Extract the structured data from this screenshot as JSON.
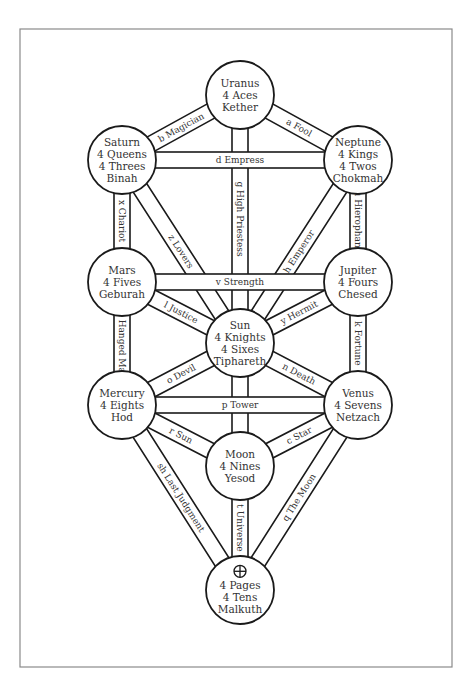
{
  "diagram": {
    "colors": {
      "line": "#1a1a1a",
      "text": "#333333",
      "frame": "#8a8a8a",
      "background": "#ffffff"
    },
    "nodes": [
      {
        "id": "kether",
        "x": 240,
        "y": 95,
        "r": 34,
        "lines": [
          "Uranus",
          "4 Aces",
          "Kether"
        ]
      },
      {
        "id": "chokmah",
        "x": 358,
        "y": 160,
        "r": 34,
        "lines": [
          "Neptune",
          "4 Kings",
          "4 Twos",
          "Chokmah"
        ]
      },
      {
        "id": "binah",
        "x": 122,
        "y": 160,
        "r": 34,
        "lines": [
          "Saturn",
          "4 Queens",
          "4 Threes",
          "Binah"
        ]
      },
      {
        "id": "chesed",
        "x": 358,
        "y": 282,
        "r": 34,
        "lines": [
          "Jupiter",
          "4 Fours",
          "Chesed"
        ]
      },
      {
        "id": "geburah",
        "x": 122,
        "y": 282,
        "r": 34,
        "lines": [
          "Mars",
          "4 Fives",
          "Geburah"
        ]
      },
      {
        "id": "tiphareth",
        "x": 240,
        "y": 343,
        "r": 34,
        "lines": [
          "Sun",
          "4 Knights",
          "4 Sixes",
          "Tiphareth"
        ]
      },
      {
        "id": "netzach",
        "x": 358,
        "y": 405,
        "r": 34,
        "lines": [
          "Venus",
          "4 Sevens",
          "Netzach"
        ]
      },
      {
        "id": "hod",
        "x": 122,
        "y": 405,
        "r": 34,
        "lines": [
          "Mercury",
          "4 Eights",
          "Hod"
        ]
      },
      {
        "id": "yesod",
        "x": 240,
        "y": 466,
        "r": 34,
        "lines": [
          "Moon",
          "4 Nines",
          "Yesod"
        ]
      },
      {
        "id": "malkuth",
        "x": 240,
        "y": 590,
        "r": 34,
        "lines": [
          "4 Pages",
          "4 Tens",
          "Malkuth"
        ],
        "glyph": "earth-symbol"
      }
    ],
    "paths": [
      {
        "from": "kether",
        "to": "chokmah",
        "letter": "a",
        "card": "Fool"
      },
      {
        "from": "kether",
        "to": "binah",
        "letter": "b",
        "card": "Magician"
      },
      {
        "from": "kether",
        "to": "tiphareth",
        "letter": "g",
        "card": "High Priestess"
      },
      {
        "from": "chokmah",
        "to": "binah",
        "letter": "d",
        "card": "Empress"
      },
      {
        "from": "chokmah",
        "to": "tiphareth",
        "letter": "h",
        "card": "Emperor"
      },
      {
        "from": "chokmah",
        "to": "chesed",
        "letter": "u",
        "card": "Hierophant"
      },
      {
        "from": "binah",
        "to": "tiphareth",
        "letter": "z",
        "card": "Lovers"
      },
      {
        "from": "binah",
        "to": "geburah",
        "letter": "x",
        "card": "Chariot"
      },
      {
        "from": "chesed",
        "to": "geburah",
        "letter": "v",
        "card": "Strength"
      },
      {
        "from": "chesed",
        "to": "tiphareth",
        "letter": "y",
        "card": "Hermit"
      },
      {
        "from": "chesed",
        "to": "netzach",
        "letter": "k",
        "card": "Fortune"
      },
      {
        "from": "geburah",
        "to": "tiphareth",
        "letter": "l",
        "card": "Justice"
      },
      {
        "from": "geburah",
        "to": "hod",
        "letter": "m",
        "card": "Hanged Man"
      },
      {
        "from": "tiphareth",
        "to": "netzach",
        "letter": "n",
        "card": "Death"
      },
      {
        "from": "tiphareth",
        "to": "yesod",
        "letter": "s",
        "card": "Temperance",
        "hidden_label": true
      },
      {
        "from": "tiphareth",
        "to": "hod",
        "letter": "o",
        "card": "Devil"
      },
      {
        "from": "netzach",
        "to": "hod",
        "letter": "p",
        "card": "Tower"
      },
      {
        "from": "netzach",
        "to": "yesod",
        "letter": "c",
        "card": "Star"
      },
      {
        "from": "netzach",
        "to": "malkuth",
        "letter": "q",
        "card": "The Moon"
      },
      {
        "from": "hod",
        "to": "yesod",
        "letter": "r",
        "card": "Sun"
      },
      {
        "from": "hod",
        "to": "malkuth",
        "letter": "sh",
        "card": "Last Judgment"
      },
      {
        "from": "yesod",
        "to": "malkuth",
        "letter": "t",
        "card": "Universe"
      }
    ],
    "path_width": 16
  }
}
